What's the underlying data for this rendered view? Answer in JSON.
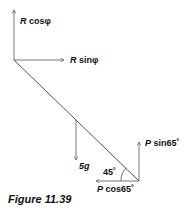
{
  "figure": {
    "caption": "Figure 11.39",
    "labels": {
      "r_cos": {
        "sym": "R",
        "text": " cosφ"
      },
      "r_sin": {
        "sym": "R",
        "text": " sinφ"
      },
      "weight": "5g",
      "p_sin": {
        "sym": "P",
        "text": " sin65˚"
      },
      "p_cos": {
        "sym": "P",
        "text": " cos65˚"
      },
      "angle": "45˚"
    }
  }
}
